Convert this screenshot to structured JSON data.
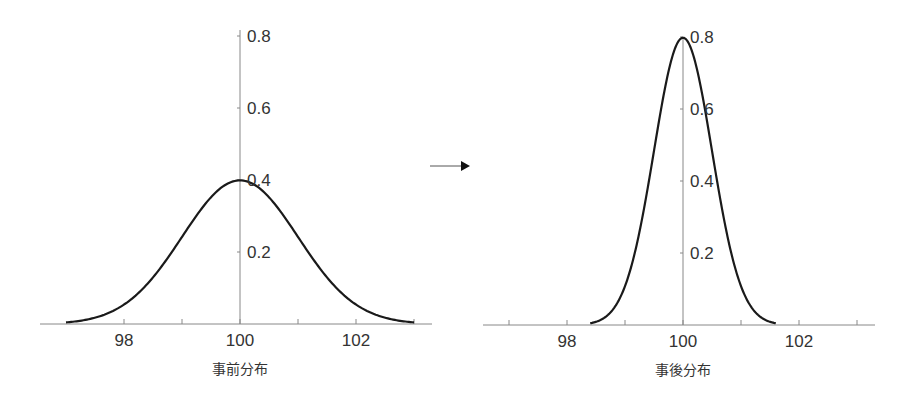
{
  "chart_data": [
    {
      "type": "line",
      "title": "事前分布",
      "xlabel": "事前分布",
      "ylabel": "",
      "distribution": {
        "kind": "normal",
        "mean": 100,
        "sd": 1
      },
      "x_ticks": [
        98,
        100,
        102
      ],
      "x_minor_ticks": [
        99,
        101,
        103
      ],
      "y_ticks": [
        0.2,
        0.4,
        0.6,
        0.8
      ],
      "xlim": [
        96.6,
        103.3
      ],
      "ylim": [
        0,
        0.8
      ],
      "x_range_plotted": [
        97,
        103
      ],
      "peak": {
        "x": 100,
        "y": 0.4
      },
      "grid": false,
      "legend": null
    },
    {
      "type": "line",
      "title": "事後分布",
      "xlabel": "事後分布",
      "ylabel": "",
      "distribution": {
        "kind": "normal",
        "mean": 100,
        "sd": 0.5
      },
      "x_ticks": [
        98,
        100,
        102
      ],
      "x_minor_ticks": [
        97,
        99,
        101,
        103
      ],
      "y_ticks": [
        0.2,
        0.4,
        0.6,
        0.8
      ],
      "xlim": [
        96.6,
        103.3
      ],
      "ylim": [
        0,
        0.8
      ],
      "x_range_plotted": [
        98.4,
        101.6
      ],
      "peak": {
        "x": 100,
        "y": 0.8
      },
      "grid": false,
      "legend": null
    }
  ],
  "labels": {
    "prior_caption": "事前分布",
    "posterior_caption": "事後分布",
    "x_tick_labels": [
      "98",
      "100",
      "102"
    ],
    "y_tick_labels": [
      "0.2",
      "0.4",
      "0.6",
      "0.8"
    ]
  },
  "arrow": {
    "direction": "right",
    "meaning": "prior-to-posterior"
  },
  "colors": {
    "curve": "#1a1a1a",
    "axis": "#888888",
    "text": "#333333"
  }
}
